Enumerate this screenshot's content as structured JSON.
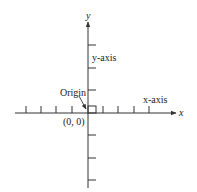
{
  "diagram": {
    "type": "cartesian-coordinate-axes",
    "labels": {
      "y_axis_end": "y",
      "x_axis_end": "x",
      "y_axis_name": "y-axis",
      "x_axis_name": "x-axis",
      "origin_label": "Origin",
      "origin_coords": "(0, 0)"
    },
    "colors": {
      "axis": "#333333",
      "text": "#222222",
      "background": "#ffffff"
    }
  }
}
